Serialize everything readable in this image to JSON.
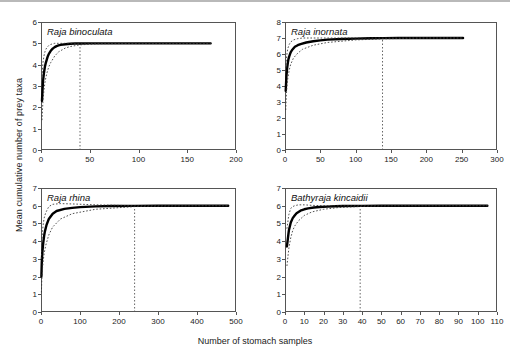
{
  "figure": {
    "ylabel": "Mean cumulative number of prey taxa",
    "xlabel": "Number of stomach samples"
  },
  "chart_data": [
    {
      "type": "line",
      "panel": "top-left",
      "title": "Raja binoculata",
      "xlabel": "Number of stomach samples",
      "ylabel": "Mean cumulative number of prey taxa",
      "xlim": [
        0,
        200
      ],
      "ylim": [
        0,
        6
      ],
      "xticks": [
        0,
        50,
        100,
        150,
        200
      ],
      "yticks": [
        0,
        1,
        2,
        3,
        4,
        5,
        6
      ],
      "grid": false,
      "legend": "none",
      "asymptote": 5,
      "reference_line_x": 40,
      "n_samples_max": 174,
      "series": [
        {
          "name": "mean cumulative prey taxa",
          "style": "solid-thick-black",
          "x": [
            1,
            2,
            3,
            4,
            5,
            6,
            7,
            8,
            9,
            10,
            12,
            14,
            16,
            18,
            20,
            25,
            30,
            35,
            40,
            50,
            60,
            80,
            100,
            120,
            140,
            160,
            174
          ],
          "y": [
            2.3,
            3.2,
            3.6,
            3.9,
            4.1,
            4.25,
            4.4,
            4.5,
            4.58,
            4.65,
            4.75,
            4.82,
            4.87,
            4.9,
            4.93,
            4.96,
            4.98,
            4.99,
            4.99,
            5.0,
            5.0,
            5.0,
            5.0,
            5.0,
            5.0,
            5.0,
            5.0
          ]
        },
        {
          "name": "upper 95% confidence limit",
          "style": "dotted-thin-black",
          "x": [
            1,
            2,
            3,
            4,
            5,
            6,
            8,
            10,
            14,
            18,
            25,
            30,
            40,
            60,
            100,
            140,
            174
          ],
          "y": [
            3.3,
            4.1,
            4.4,
            4.6,
            4.72,
            4.8,
            4.9,
            4.95,
            5.0,
            5.0,
            5.0,
            5.0,
            5.0,
            5.0,
            5.0,
            5.0,
            5.0
          ]
        },
        {
          "name": "lower 95% confidence limit",
          "style": "dotted-thin-black",
          "x": [
            1,
            2,
            3,
            4,
            5,
            6,
            8,
            10,
            14,
            18,
            25,
            30,
            40,
            60,
            100,
            140,
            174
          ],
          "y": [
            1.4,
            2.3,
            2.8,
            3.15,
            3.4,
            3.6,
            3.9,
            4.1,
            4.4,
            4.6,
            4.78,
            4.85,
            4.93,
            4.98,
            5.0,
            5.0,
            5.0
          ]
        }
      ]
    },
    {
      "type": "line",
      "panel": "top-right",
      "title": "Raja inornata",
      "xlabel": "Number of stomach samples",
      "ylabel": "Mean cumulative number of prey taxa",
      "xlim": [
        0,
        300
      ],
      "ylim": [
        0,
        8
      ],
      "xticks": [
        0,
        50,
        100,
        150,
        200,
        250,
        300
      ],
      "yticks": [
        0,
        1,
        2,
        3,
        4,
        5,
        6,
        7,
        8
      ],
      "grid": false,
      "legend": "none",
      "asymptote": 7,
      "reference_line_x": 138,
      "n_samples_max": 252,
      "series": [
        {
          "name": "mean cumulative prey taxa",
          "style": "solid-thick-black",
          "x": [
            1,
            2,
            3,
            4,
            5,
            6,
            8,
            10,
            14,
            18,
            22,
            30,
            40,
            50,
            60,
            80,
            100,
            120,
            140,
            160,
            200,
            252
          ],
          "y": [
            3.7,
            4.6,
            5.1,
            5.45,
            5.7,
            5.85,
            6.1,
            6.25,
            6.45,
            6.55,
            6.62,
            6.72,
            6.8,
            6.85,
            6.9,
            6.94,
            6.96,
            6.98,
            6.99,
            7.0,
            7.0,
            7.0
          ]
        },
        {
          "name": "upper 95% confidence limit",
          "style": "dotted-thin-black",
          "x": [
            1,
            2,
            3,
            4,
            6,
            8,
            12,
            18,
            25,
            40,
            60,
            100,
            140,
            200,
            252
          ],
          "y": [
            4.9,
            5.7,
            6.1,
            6.35,
            6.6,
            6.75,
            6.88,
            6.96,
            7.0,
            7.0,
            7.0,
            7.0,
            7.0,
            7.0,
            7.0
          ]
        },
        {
          "name": "lower 95% confidence limit",
          "style": "dotted-thin-black",
          "x": [
            1,
            2,
            3,
            4,
            6,
            8,
            12,
            18,
            25,
            40,
            60,
            100,
            140,
            200,
            252
          ],
          "y": [
            2.5,
            3.5,
            4.1,
            4.5,
            5.0,
            5.35,
            5.75,
            6.05,
            6.3,
            6.55,
            6.72,
            6.88,
            6.95,
            7.0,
            7.0
          ]
        }
      ]
    },
    {
      "type": "line",
      "panel": "bottom-left",
      "title": "Raja rhina",
      "xlabel": "Number of stomach samples",
      "ylabel": "Mean cumulative number of prey taxa",
      "xlim": [
        0,
        500
      ],
      "ylim": [
        0,
        7
      ],
      "xticks": [
        0,
        100,
        200,
        300,
        400,
        500
      ],
      "yticks": [
        0,
        1,
        2,
        3,
        4,
        5,
        6,
        7
      ],
      "grid": false,
      "legend": "none",
      "asymptote": 6,
      "reference_line_x": 240,
      "n_samples_max": 480,
      "series": [
        {
          "name": "mean cumulative prey taxa",
          "style": "solid-thick-black",
          "x": [
            1,
            2,
            3,
            4,
            5,
            6,
            8,
            10,
            14,
            20,
            30,
            40,
            60,
            80,
            100,
            140,
            180,
            240,
            300,
            400,
            480
          ],
          "y": [
            2.0,
            2.8,
            3.2,
            3.5,
            3.75,
            3.95,
            4.3,
            4.55,
            4.9,
            5.25,
            5.55,
            5.7,
            5.82,
            5.88,
            5.92,
            5.96,
            5.98,
            5.99,
            6.0,
            6.0,
            6.0
          ]
        },
        {
          "name": "upper 95% confidence limit",
          "style": "dotted-thin-black",
          "x": [
            1,
            2,
            3,
            4,
            6,
            8,
            12,
            20,
            30,
            50,
            80,
            140,
            240,
            400,
            480
          ],
          "y": [
            3.0,
            3.8,
            4.3,
            4.6,
            5.0,
            5.3,
            5.6,
            5.95,
            6.08,
            6.12,
            6.1,
            6.05,
            6.0,
            6.0,
            6.0
          ]
        },
        {
          "name": "lower 95% confidence limit",
          "style": "dotted-thin-black",
          "x": [
            1,
            2,
            3,
            4,
            6,
            8,
            12,
            20,
            30,
            50,
            80,
            140,
            240,
            400,
            480
          ],
          "y": [
            1.1,
            1.8,
            2.2,
            2.5,
            2.95,
            3.3,
            3.75,
            4.35,
            4.8,
            5.25,
            5.55,
            5.8,
            5.95,
            6.0,
            6.0
          ]
        }
      ]
    },
    {
      "type": "line",
      "panel": "bottom-right",
      "title": "Bathyraja kincaidii",
      "xlabel": "Number of stomach samples",
      "ylabel": "Mean cumulative number of prey taxa",
      "xlim": [
        0,
        110
      ],
      "ylim": [
        0,
        7
      ],
      "xticks": [
        0,
        10,
        20,
        30,
        40,
        50,
        60,
        70,
        80,
        90,
        100,
        110
      ],
      "yticks": [
        0,
        1,
        2,
        3,
        4,
        5,
        6,
        7
      ],
      "grid": false,
      "legend": "none",
      "asymptote": 6,
      "reference_line_x": 39,
      "n_samples_max": 105,
      "series": [
        {
          "name": "mean cumulative prey taxa",
          "style": "solid-thick-black",
          "x": [
            1,
            2,
            3,
            4,
            5,
            6,
            7,
            8,
            10,
            12,
            15,
            18,
            22,
            26,
            30,
            40,
            50,
            70,
            90,
            105
          ],
          "y": [
            3.7,
            4.6,
            5.05,
            5.3,
            5.45,
            5.58,
            5.65,
            5.72,
            5.8,
            5.85,
            5.9,
            5.93,
            5.95,
            5.97,
            5.98,
            5.99,
            6.0,
            6.0,
            6.0,
            6.0
          ]
        },
        {
          "name": "upper 95% confidence limit",
          "style": "dotted-thin-black",
          "x": [
            1,
            2,
            3,
            4,
            5,
            7,
            10,
            14,
            20,
            28,
            40,
            60,
            105
          ],
          "y": [
            4.7,
            5.5,
            5.85,
            5.95,
            6.0,
            6.05,
            6.05,
            6.02,
            6.0,
            6.0,
            6.0,
            6.0,
            6.0
          ]
        },
        {
          "name": "lower 95% confidence limit",
          "style": "dotted-thin-black",
          "x": [
            1,
            2,
            3,
            4,
            5,
            7,
            10,
            14,
            20,
            28,
            40,
            60,
            105
          ],
          "y": [
            2.6,
            3.6,
            4.2,
            4.6,
            4.85,
            5.15,
            5.45,
            5.65,
            5.8,
            5.9,
            5.96,
            6.0,
            6.0
          ]
        }
      ]
    }
  ]
}
